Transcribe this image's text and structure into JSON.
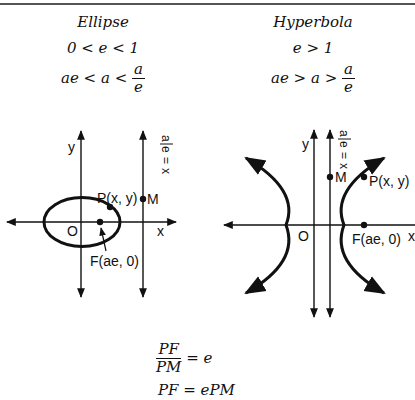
{
  "ellipse": {
    "title": "Ellipse",
    "condition": "0 < e < 1",
    "inequality": {
      "lhs": "ae < a <",
      "frac_num": "a",
      "frac_den": "e"
    },
    "labels": {
      "y_axis": "y",
      "x_axis": "x",
      "origin": "O",
      "point_p": "P(x, y)",
      "point_m": "M",
      "focus": "F(ae, 0)",
      "directrix": "x = a/e"
    }
  },
  "hyperbola": {
    "title": "Hyperbola",
    "condition": "e > 1",
    "inequality": {
      "lhs": "ae > a >",
      "frac_num": "a",
      "frac_den": "e"
    },
    "labels": {
      "y_axis": "y",
      "x_axis": "x",
      "origin": "O",
      "point_p": "P(x, y)",
      "point_m": "M",
      "focus": "F(ae, 0)",
      "directrix": "x = a/e"
    }
  },
  "formulas": {
    "ratio_num": "PF",
    "ratio_den": "PM",
    "ratio_rhs": "= e",
    "product": "PF = ePM"
  }
}
